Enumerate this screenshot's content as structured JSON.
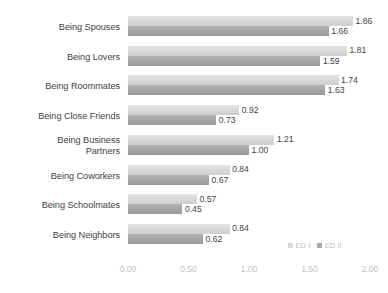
{
  "chart_data": {
    "type": "bar",
    "orientation": "horizontal",
    "title": "",
    "subtitle": "",
    "xlabel": "",
    "ylabel": "",
    "xlim": [
      0.0,
      2.0
    ],
    "xticks": [
      "0.00",
      "0.50",
      "1.00",
      "1.50",
      "2.00"
    ],
    "xtick_values": [
      0.0,
      0.5,
      1.0,
      1.5,
      2.0
    ],
    "grid": false,
    "legend_position": "bottom-right",
    "categories": [
      "Being Spouses",
      "Being Lovers",
      "Being Roommates",
      "Being Close Friends",
      "Being Business\nPartners",
      "Being Coworkers",
      "Being Schoolmates",
      "Being Neighbors"
    ],
    "series": [
      {
        "name": "ED I",
        "color": "#d9d9d9",
        "values": [
          1.86,
          1.81,
          1.74,
          0.92,
          1.21,
          0.84,
          0.57,
          0.84
        ],
        "labels": [
          "1.86",
          "1.81",
          "1.74",
          "0.92",
          "1.21",
          "0.84",
          "0.57",
          "0.84"
        ]
      },
      {
        "name": "ED II",
        "color": "#a6a6a6",
        "values": [
          1.66,
          1.59,
          1.63,
          0.73,
          1.0,
          0.67,
          0.45,
          0.62
        ],
        "labels": [
          "1.66",
          "1.59",
          "1.63",
          "0.73",
          "1.00",
          "0.67",
          "0.45",
          "0.62"
        ]
      }
    ]
  },
  "legend": {
    "items": [
      {
        "label": "ED I",
        "color": "#d9d9d9"
      },
      {
        "label": "ED II",
        "color": "#a6a6a6"
      }
    ]
  }
}
